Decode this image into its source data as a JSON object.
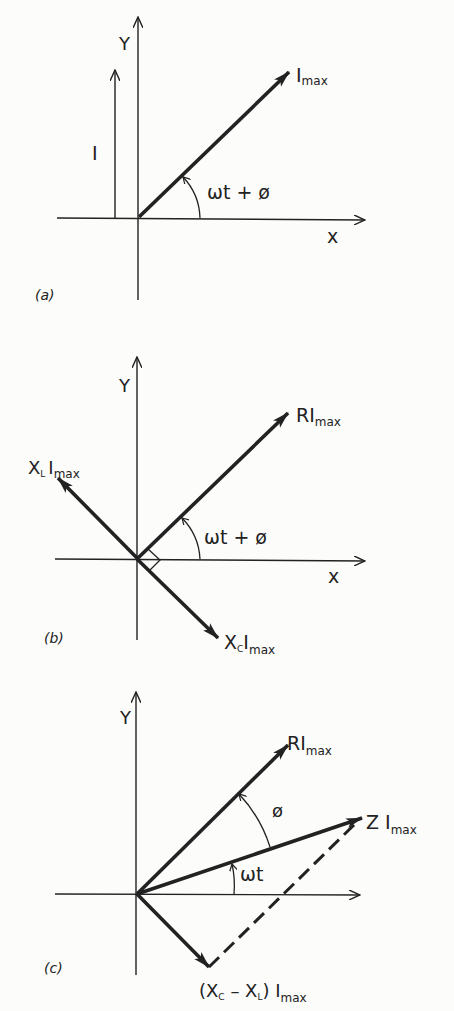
{
  "figure": {
    "ink_color": "#222222",
    "background": "#fcfcfb"
  },
  "panels": [
    {
      "id": "a",
      "tag": "(a)",
      "axis_x": "x",
      "axis_y": "Y",
      "phasor_label": "I",
      "phasor_sub": "max",
      "projection_label": "I",
      "angle_label": "ωt + ø"
    },
    {
      "id": "b",
      "tag": "(b)",
      "axis_x": "x",
      "axis_y": "Y",
      "resistor_label": "RI",
      "resistor_sub": "max",
      "inductor_label": "X",
      "inductor_sub1": "L",
      "inductor_label2": "I",
      "inductor_sub2": "max",
      "capacitor_label": "X",
      "capacitor_sub1": "C",
      "capacitor_label2": "I",
      "capacitor_sub2": "max",
      "angle_label": "ωt + ø"
    },
    {
      "id": "c",
      "tag": "(c)",
      "axis_y": "Y",
      "resistor_label": "RI",
      "resistor_sub": "max",
      "impedance_label": "Z I",
      "impedance_sub": "max",
      "reactance_label_open": "(X",
      "reactance_sub1": "C",
      "reactance_minus": " – X",
      "reactance_sub2": "L",
      "reactance_label_close": ") I",
      "reactance_sub3": "max",
      "phi_label": "ø",
      "omega_label": "ωt"
    }
  ]
}
